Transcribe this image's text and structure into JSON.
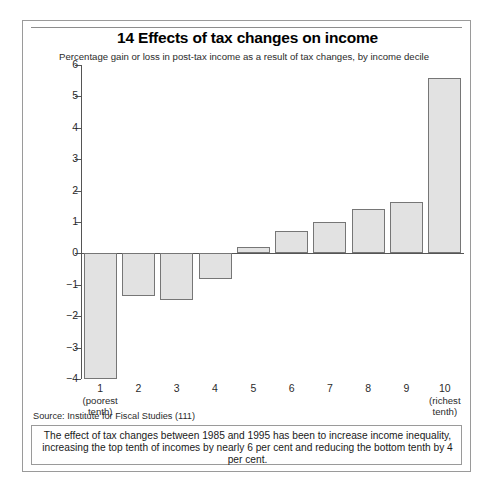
{
  "figure": {
    "title": "14 Effects of tax changes on income",
    "subtitle": "Percentage gain or loss in post-tax income as a result of tax changes, by income decile",
    "source": "Source: Institute for Fiscal Studies (111)",
    "caption": "The effect of tax changes between 1985 and 1995 has been to increase income inequality, increasing the top tenth of incomes by nearly 6 per cent and reducing the bottom tenth by 4 per cent."
  },
  "colors": {
    "bar_fill": "#e2e2e2",
    "bar_border": "#767676",
    "axis": "#555555",
    "frame": "#9a9a9a",
    "text": "#1a1a1a"
  },
  "chart_data": {
    "type": "bar",
    "title": "14 Effects of tax changes on income",
    "subtitle": "Percentage gain or loss in post-tax income as a result of tax changes, by income decile",
    "xlabel": "",
    "ylabel": "",
    "ylim": [
      -4,
      6
    ],
    "ytick_step": 1,
    "grid": false,
    "legend": "none",
    "categories": [
      "1",
      "2",
      "3",
      "4",
      "5",
      "6",
      "7",
      "8",
      "9",
      "10"
    ],
    "category_notes": {
      "1": "(poorest tenth)",
      "10": "(richest tenth)"
    },
    "values": [
      -4.0,
      -1.35,
      -1.5,
      -0.8,
      0.2,
      0.7,
      1.0,
      1.4,
      1.65,
      5.6
    ],
    "ytick_labels": [
      "6",
      "5",
      "4",
      "3",
      "2",
      "1",
      "0",
      "−1",
      "−2",
      "−3",
      "−4"
    ],
    "ytick_values": [
      6,
      5,
      4,
      3,
      2,
      1,
      0,
      -1,
      -2,
      -3,
      -4
    ]
  }
}
